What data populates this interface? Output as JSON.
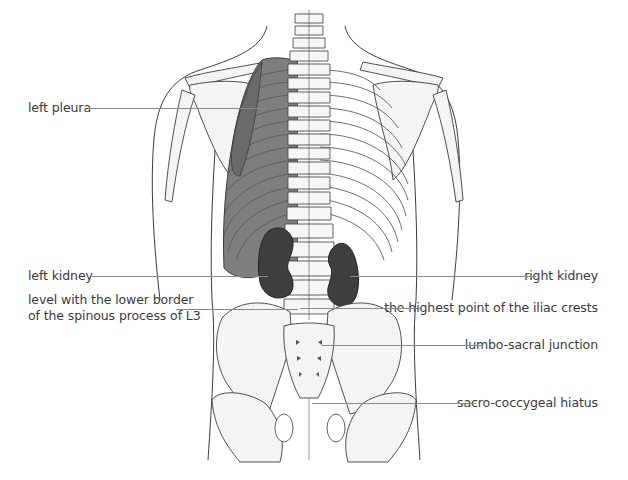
{
  "figure": {
    "colors": {
      "outline": "#3c3c3c",
      "bone_fill": "#f4f4f2",
      "pleura_fill": "#7a7a7a",
      "pleura_dark": "#6a6a6a",
      "kidney_fill": "#3e3e3e",
      "leader_line": "#8a8a8a",
      "label_text": "#3a3a3a"
    }
  },
  "labels": {
    "left_pleura": "left pleura",
    "left_kidney": "left kidney",
    "l3_line1": "level with the lower border",
    "l3_line2": "of the spinous process of L3",
    "right_kidney": "right kidney",
    "iliac_crests": "the highest point of the iliac crests",
    "lumbo_sacral": "lumbo-sacral junction",
    "sacro_coccygeal": "sacro-coccygeal hiatus"
  }
}
